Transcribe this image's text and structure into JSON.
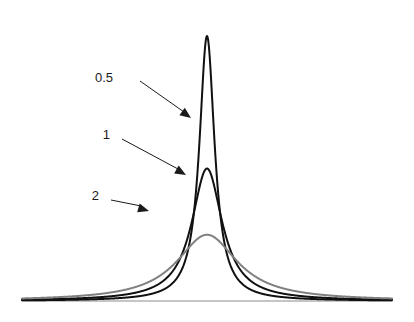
{
  "figure": {
    "name": "cauchy-density-comparison",
    "background_color": "#ffffff",
    "width": 414,
    "height": 322
  },
  "axis": {
    "baseline_color": "#8c8c8c",
    "baseline_width": 1.2,
    "x_start": 22,
    "x_end": 392,
    "y": 301
  },
  "annotations": [
    {
      "id": "ann-05",
      "label": "0.5",
      "text_x": 113,
      "text_y": 79,
      "line_from_x": 140,
      "line_from_y": 81,
      "line_to_x": 184,
      "line_to_y": 112,
      "head_x": 191,
      "head_y": 118,
      "color": "#1a1a1a",
      "target_series": "0.5"
    },
    {
      "id": "ann-1",
      "label": "1",
      "text_x": 110,
      "text_y": 136,
      "line_from_x": 122,
      "line_from_y": 139,
      "line_to_x": 178,
      "line_to_y": 169,
      "head_x": 186,
      "head_y": 175,
      "color": "#1a1a1a",
      "target_series": "1"
    },
    {
      "id": "ann-2",
      "label": "2",
      "text_x": 99,
      "text_y": 197,
      "line_from_x": 111,
      "line_from_y": 200,
      "line_to_x": 141,
      "line_to_y": 206,
      "head_x": 149,
      "head_y": 211,
      "color": "#1a1a1a",
      "target_series": "2"
    }
  ],
  "chart_data": {
    "type": "line",
    "title": "",
    "subtitle": "",
    "xlabel": "",
    "ylabel": "",
    "grid": false,
    "legend_position": "inline-annotations",
    "distribution": "cauchy",
    "x_center": 0,
    "xlim": [
      -10,
      10
    ],
    "ylim": [
      0,
      0.68
    ],
    "x_tick_labels": [],
    "y_tick_labels": [],
    "annotation_labels": [
      "0.5",
      "1",
      "2"
    ],
    "series": [
      {
        "name": "0.5",
        "scale": 0.5,
        "color": "#111111",
        "line_width": 2.0,
        "peak_value": 0.6366,
        "peak_x": 0,
        "x": [
          -10,
          -9,
          -8,
          -7,
          -6,
          -5,
          -4,
          -3,
          -2.5,
          -2,
          -1.5,
          -1.2,
          -1,
          -0.8,
          -0.6,
          -0.5,
          -0.4,
          -0.3,
          -0.2,
          -0.1,
          0,
          0.1,
          0.2,
          0.3,
          0.4,
          0.5,
          0.6,
          0.8,
          1,
          1.2,
          1.5,
          2,
          2.5,
          3,
          4,
          5,
          6,
          7,
          8,
          9,
          10
        ],
        "values": [
          0.00158,
          0.00195,
          0.00247,
          0.00322,
          0.00438,
          0.0063,
          0.0098,
          0.01726,
          0.02476,
          0.0382,
          0.06631,
          0.09441,
          0.12732,
          0.17551,
          0.24492,
          0.31831,
          0.38862,
          0.46786,
          0.54507,
          0.60724,
          0.63662,
          0.60724,
          0.54507,
          0.46786,
          0.38862,
          0.31831,
          0.24492,
          0.17551,
          0.12732,
          0.09441,
          0.06631,
          0.0382,
          0.02476,
          0.01726,
          0.0098,
          0.0063,
          0.00438,
          0.00322,
          0.00247,
          0.00195,
          0.00158
        ]
      },
      {
        "name": "1",
        "scale": 1,
        "color": "#111111",
        "line_width": 2.0,
        "peak_value": 0.3183,
        "peak_x": 0,
        "x": [
          -10,
          -9,
          -8,
          -7,
          -6,
          -5,
          -4,
          -3,
          -2.5,
          -2,
          -1.5,
          -1.2,
          -1,
          -0.8,
          -0.6,
          -0.5,
          -0.4,
          -0.3,
          -0.2,
          -0.1,
          0,
          0.1,
          0.2,
          0.3,
          0.4,
          0.5,
          0.6,
          0.8,
          1,
          1.2,
          1.5,
          2,
          2.5,
          3,
          4,
          5,
          6,
          7,
          8,
          9,
          10
        ],
        "values": [
          0.00315,
          0.00388,
          0.0049,
          0.00637,
          0.0086,
          0.01224,
          0.01872,
          0.03183,
          0.0439,
          0.06366,
          0.09794,
          0.12026,
          0.15915,
          0.19411,
          0.23423,
          0.25465,
          0.27437,
          0.29213,
          0.30604,
          0.31515,
          0.31831,
          0.31515,
          0.30604,
          0.29213,
          0.27437,
          0.25465,
          0.23423,
          0.19411,
          0.15915,
          0.12026,
          0.09794,
          0.06366,
          0.0439,
          0.03183,
          0.01872,
          0.01224,
          0.0086,
          0.00637,
          0.0049,
          0.00388,
          0.00315
        ]
      },
      {
        "name": "2",
        "scale": 2,
        "color": "#808080",
        "line_width": 2.0,
        "peak_value": 0.1592,
        "peak_x": 0,
        "x": [
          -10,
          -9,
          -8,
          -7,
          -6,
          -5,
          -4,
          -3,
          -2.5,
          -2,
          -1.5,
          -1.2,
          -1,
          -0.8,
          -0.6,
          -0.5,
          -0.4,
          -0.3,
          -0.2,
          -0.1,
          0,
          0.1,
          0.2,
          0.3,
          0.4,
          0.5,
          0.6,
          0.8,
          1,
          1.2,
          1.5,
          2,
          2.5,
          3,
          4,
          5,
          6,
          7,
          8,
          9,
          10
        ],
        "values": [
          0.00612,
          0.0075,
          0.00937,
          0.012,
          0.01592,
          0.02185,
          0.03183,
          0.04897,
          0.06183,
          0.07958,
          0.10186,
          0.1158,
          0.12732,
          0.13811,
          0.14795,
          0.15244,
          0.15656,
          0.16007,
          0.16292,
          0.16472,
          0.15915,
          0.16472,
          0.16292,
          0.16007,
          0.15656,
          0.15244,
          0.14795,
          0.13811,
          0.12732,
          0.1158,
          0.10186,
          0.07958,
          0.06183,
          0.04897,
          0.03183,
          0.02185,
          0.01592,
          0.012,
          0.00937,
          0.0075,
          0.00612
        ]
      }
    ]
  }
}
